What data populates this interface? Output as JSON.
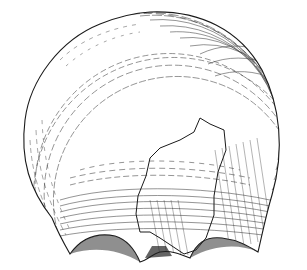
{
  "figure": {
    "style": "line-hatching illustration",
    "colors": {
      "ink": "#1a1a1a",
      "paper": "#ffffff"
    }
  }
}
